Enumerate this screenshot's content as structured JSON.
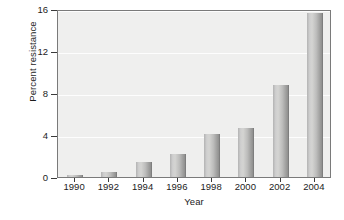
{
  "chart_data": {
    "type": "bar",
    "title": "",
    "xlabel": "Year",
    "ylabel": "Percent resistance",
    "categories": [
      "1990",
      "1992",
      "1994",
      "1996",
      "1998",
      "2000",
      "2002",
      "2004"
    ],
    "values": [
      0.2,
      0.5,
      1.4,
      2.2,
      4.1,
      4.7,
      8.8,
      15.6
    ],
    "ylim": [
      0,
      16
    ],
    "yticks": [
      0,
      4,
      8,
      12,
      16
    ],
    "ytick_labels": [
      "0",
      "4",
      "8",
      "12",
      "16"
    ],
    "xtick_labels": [
      "1990",
      "1992",
      "1994",
      "1996",
      "1998",
      "2000",
      "2002",
      "2004"
    ],
    "grid": true,
    "grid_axis": "y",
    "legend": null,
    "legend_position": "none",
    "bar_color": "#c4c4c3",
    "plot_background": "#efefee",
    "figure_background": "#ffffff",
    "axis_color": "#7a7a7a",
    "gridline_color": "#fdfdfd",
    "text_color": "#1c1c1c"
  }
}
